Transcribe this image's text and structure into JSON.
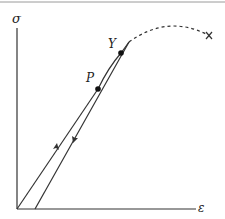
{
  "diagram": {
    "type": "stress-strain-curve",
    "axes": {
      "y_label": "σ",
      "x_label": "ε"
    },
    "points": [
      {
        "id": "P",
        "label": "P",
        "meaning": "proportional limit"
      },
      {
        "id": "Y",
        "label": "Y",
        "meaning": "yield point"
      }
    ],
    "end_marker": "×",
    "segments": [
      {
        "name": "loading-line",
        "style": "solid",
        "arrow": "up"
      },
      {
        "name": "plastic-curve",
        "style": "solid"
      },
      {
        "name": "unloading-line",
        "style": "solid",
        "arrow": "down"
      },
      {
        "name": "continuation-to-fracture",
        "style": "dashed"
      }
    ]
  },
  "colors": {
    "line": "#333333",
    "background": "#ffffff",
    "top_rule": "#9a9a9a"
  }
}
